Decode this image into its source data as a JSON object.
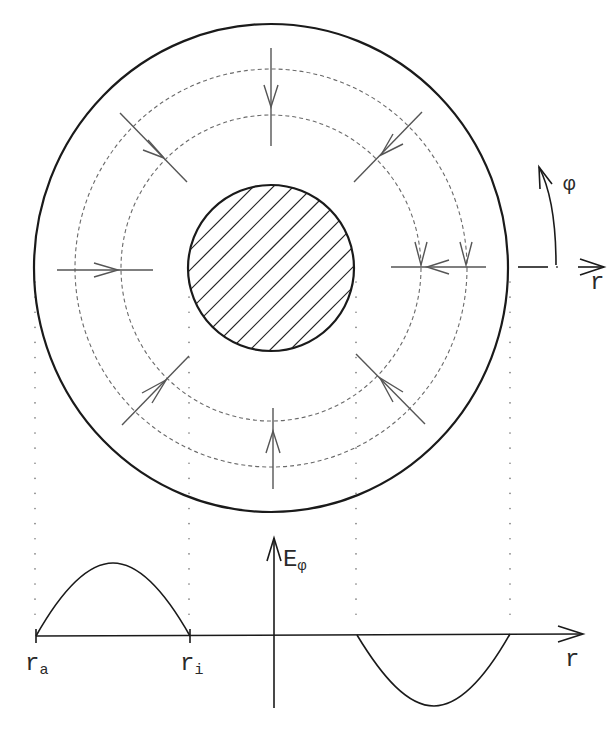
{
  "figure": {
    "type": "field-lines-in-coaxial-region",
    "top_view": {
      "outer_circle": {
        "label": "r_a"
      },
      "inner_conductor": {
        "label": "r_i",
        "fill": "hatched"
      },
      "dashed_field_circles": 2,
      "radial_arrows": 8,
      "coordinate_labels": {
        "phi": "φ",
        "r": "r"
      }
    },
    "plot": {
      "y_axis_label_main": "E",
      "y_axis_label_sub": "φ",
      "x_axis_label": "r",
      "tick_labels": [
        {
          "main": "r",
          "sub": "a"
        },
        {
          "main": "r",
          "sub": "i"
        }
      ]
    }
  },
  "colors": {
    "line": "#1a1a1a",
    "arrow": "#555555",
    "dash": "#6a6a6a"
  }
}
